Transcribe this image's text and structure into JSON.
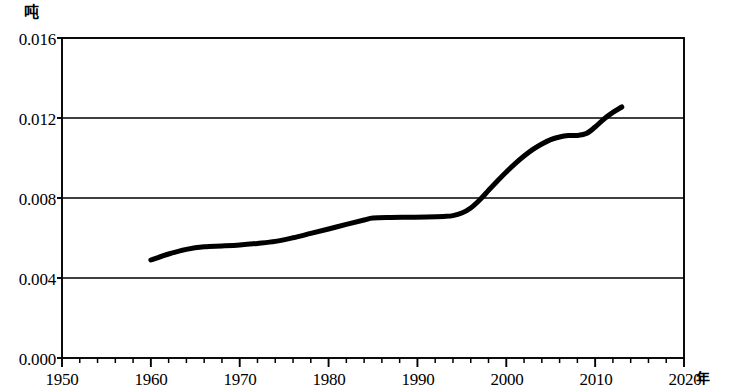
{
  "axes": {
    "y_unit_label": "吨",
    "x_unit_label": "年",
    "y_ticks": [
      "0.000",
      "0.004",
      "0.008",
      "0.012",
      "0.016"
    ],
    "x_ticks": [
      "1950",
      "1960",
      "1970",
      "1980",
      "1990",
      "2000",
      "2010",
      "2020"
    ]
  },
  "chart_data": {
    "type": "line",
    "title": "",
    "subtitle": "",
    "xlabel": "年",
    "ylabel": "吨",
    "xlim": [
      1950,
      2020
    ],
    "ylim": [
      0.0,
      0.016
    ],
    "x_tick_values": [
      1950,
      1960,
      1970,
      1980,
      1990,
      2000,
      2010,
      2020
    ],
    "y_tick_values": [
      0.0,
      0.004,
      0.008,
      0.012,
      0.016
    ],
    "x_minor_tick_interval": 2,
    "grid": "horizontal",
    "legend": "none",
    "line_color": "#000000",
    "line_width_px": 5,
    "series": [
      {
        "name": "",
        "x": [
          1960,
          1962,
          1964,
          1966,
          1968,
          1970,
          1972,
          1974,
          1976,
          1978,
          1980,
          1982,
          1984,
          1985,
          1987,
          1989,
          1991,
          1993,
          1994,
          1995,
          1996,
          1997,
          1998,
          1999,
          2000,
          2001,
          2002,
          2003,
          2004,
          2005,
          2006,
          2007,
          2008,
          2009,
          2010,
          2011,
          2012,
          2013
        ],
        "values": [
          0.0049,
          0.0052,
          0.00543,
          0.00556,
          0.0056,
          0.00565,
          0.00573,
          0.00583,
          0.00601,
          0.00623,
          0.00645,
          0.00668,
          0.0069,
          0.007,
          0.00703,
          0.00704,
          0.00705,
          0.00708,
          0.00712,
          0.00725,
          0.0075,
          0.0079,
          0.00838,
          0.00885,
          0.0093,
          0.00972,
          0.0101,
          0.01043,
          0.0107,
          0.01092,
          0.01105,
          0.01112,
          0.01113,
          0.01122,
          0.01155,
          0.01195,
          0.01228,
          0.01255
        ]
      }
    ]
  }
}
